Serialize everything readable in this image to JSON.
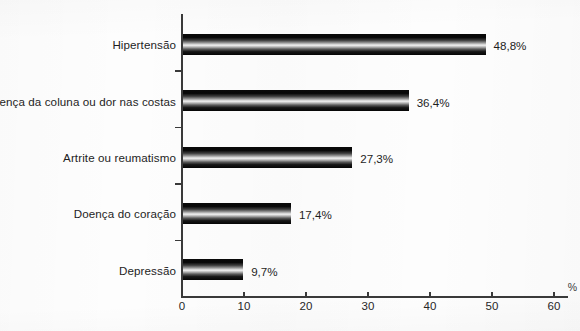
{
  "chart_data": {
    "type": "bar",
    "orientation": "horizontal",
    "title": "",
    "xlabel": "%",
    "ylabel": "",
    "xlim": [
      0,
      60
    ],
    "xticks": [
      0,
      10,
      20,
      30,
      40,
      50,
      60
    ],
    "xticklabels": [
      "0",
      "10",
      "20",
      "30",
      "40",
      "50",
      "60"
    ],
    "grid": false,
    "legend": null,
    "categories": [
      "Hipertensão",
      "Doença da coluna ou dor nas costas",
      "Artrite ou reumatismo",
      "Doença do coração",
      "Depressão"
    ],
    "values": [
      48.8,
      36.4,
      27.3,
      17.4,
      9.7
    ],
    "data_labels": [
      "48,8%",
      "36,4%",
      "27,3%",
      "17,4%",
      "9,7%"
    ]
  },
  "axis": {
    "unit_symbol": "%"
  }
}
